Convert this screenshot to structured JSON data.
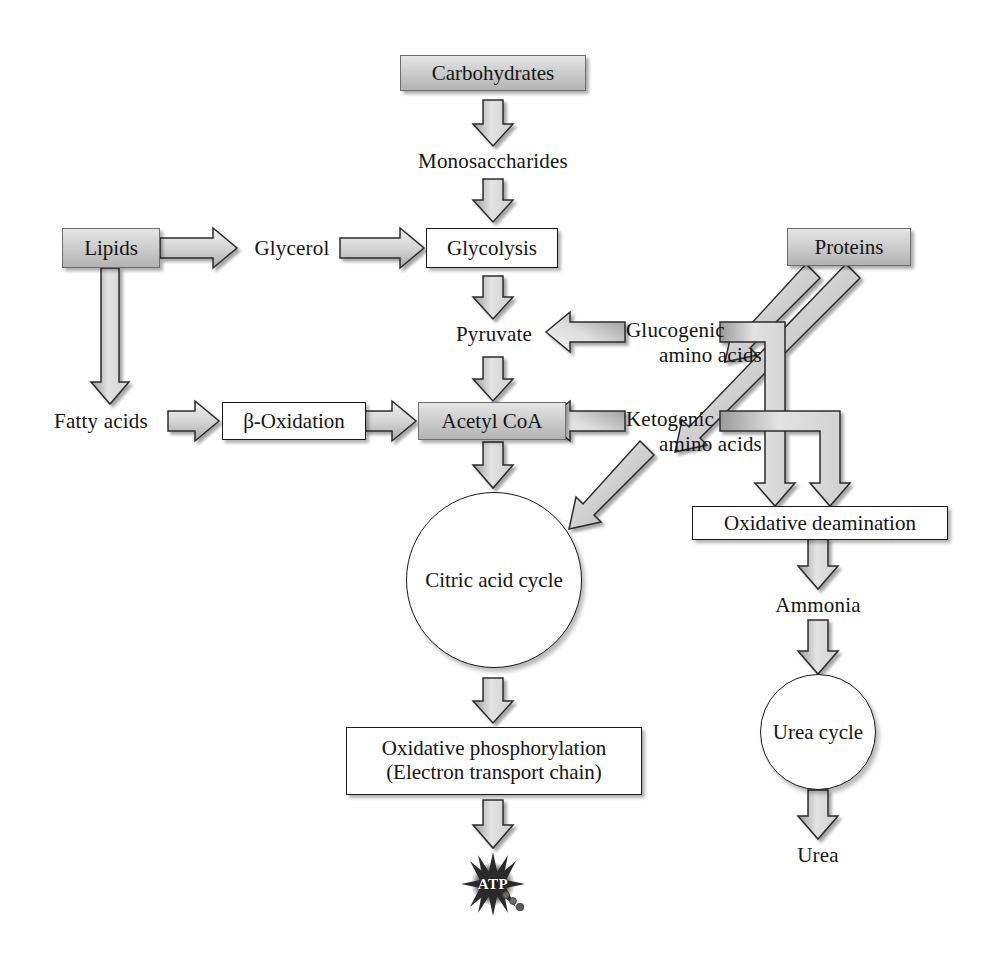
{
  "diagram": {
    "colors": {
      "fill_gray_light": "#e6e6e6",
      "fill_gray_dark": "#b3b3b3",
      "arrow_fill": "#d8d8d8",
      "stroke": "#1a1a1a",
      "background": "#ffffff"
    },
    "nodes": {
      "carbohydrates": "Carbohydrates",
      "monosaccharides": "Monosaccharides",
      "glycolysis": "Glycolysis",
      "pyruvate": "Pyruvate",
      "acetyl_coa": "Acetyl CoA",
      "citric_acid_cycle": "Citric acid cycle",
      "oxidative_phosphorylation_line1": "Oxidative phosphorylation",
      "oxidative_phosphorylation_line2": "(Electron transport chain)",
      "atp": "ATP",
      "lipids": "Lipids",
      "glycerol": "Glycerol",
      "fatty_acids": "Fatty acids",
      "beta_oxidation": "β-Oxidation",
      "proteins": "Proteins",
      "glucogenic_line1": "Glucogenic",
      "glucogenic_line2": "amino acids",
      "ketogenic_line1": "Ketogenic",
      "ketogenic_line2": "amino acids",
      "oxidative_deamination": "Oxidative deamination",
      "ammonia": "Ammonia",
      "urea_cycle": "Urea cycle",
      "urea": "Urea"
    },
    "edges": [
      {
        "from": "carbohydrates",
        "to": "monosaccharides",
        "direction": "down"
      },
      {
        "from": "monosaccharides",
        "to": "glycolysis",
        "direction": "down"
      },
      {
        "from": "glycolysis",
        "to": "pyruvate",
        "direction": "down"
      },
      {
        "from": "pyruvate",
        "to": "acetyl_coa",
        "direction": "down"
      },
      {
        "from": "acetyl_coa",
        "to": "citric_acid_cycle",
        "direction": "down"
      },
      {
        "from": "citric_acid_cycle",
        "to": "oxidative_phosphorylation",
        "direction": "down"
      },
      {
        "from": "oxidative_phosphorylation",
        "to": "atp",
        "direction": "down"
      },
      {
        "from": "lipids",
        "to": "glycerol",
        "direction": "right"
      },
      {
        "from": "glycerol",
        "to": "glycolysis",
        "direction": "right"
      },
      {
        "from": "lipids",
        "to": "fatty_acids",
        "direction": "down"
      },
      {
        "from": "fatty_acids",
        "to": "beta_oxidation",
        "direction": "right"
      },
      {
        "from": "beta_oxidation",
        "to": "acetyl_coa",
        "direction": "right"
      },
      {
        "from": "proteins",
        "to": "glucogenic_amino_acids",
        "direction": "diagonal-down-left"
      },
      {
        "from": "proteins",
        "to": "ketogenic_amino_acids",
        "direction": "diagonal-down-left"
      },
      {
        "from": "glucogenic_amino_acids",
        "to": "pyruvate",
        "direction": "left"
      },
      {
        "from": "ketogenic_amino_acids",
        "to": "acetyl_coa",
        "direction": "left"
      },
      {
        "from": "ketogenic_amino_acids",
        "to": "citric_acid_cycle",
        "direction": "diagonal-down-left"
      },
      {
        "from": "glucogenic_amino_acids",
        "to": "oxidative_deamination",
        "direction": "elbow-down"
      },
      {
        "from": "ketogenic_amino_acids",
        "to": "oxidative_deamination",
        "direction": "elbow-down"
      },
      {
        "from": "oxidative_deamination",
        "to": "ammonia",
        "direction": "down"
      },
      {
        "from": "ammonia",
        "to": "urea_cycle",
        "direction": "down"
      },
      {
        "from": "urea_cycle",
        "to": "urea",
        "direction": "down"
      }
    ]
  }
}
